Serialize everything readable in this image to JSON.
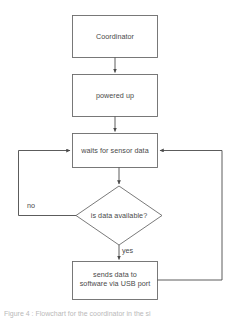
{
  "figure": {
    "type": "flowchart",
    "background_color": "#ffffff",
    "stroke_color": "#595959",
    "text_color": "#4a4a4a",
    "caption": "Figure 4 : Flowchart for the coordinator in the si"
  },
  "nodes": [
    {
      "id": "coordinator",
      "shape": "rectangle",
      "label": "Coordinator",
      "x": 72,
      "y": 15,
      "width": 86,
      "height": 43
    },
    {
      "id": "powered-up",
      "shape": "rectangle",
      "label": "powered up",
      "x": 72,
      "y": 74,
      "width": 86,
      "height": 43
    },
    {
      "id": "waits-for-sensor-data",
      "shape": "rectangle",
      "label": "waits for sensor data",
      "x": 72,
      "y": 133,
      "width": 86,
      "height": 35
    },
    {
      "id": "is-data-available",
      "shape": "diamond",
      "label": "is data available?",
      "x": 76,
      "y": 186,
      "width": 86,
      "height": 59
    },
    {
      "id": "sends-data",
      "shape": "rectangle",
      "label": "sends data to\nsoftware via USB port",
      "x": 72,
      "y": 261,
      "width": 86,
      "height": 39
    }
  ],
  "edges": [
    {
      "id": "coordinator-to-powered-up",
      "from": "coordinator",
      "to": "powered-up",
      "label": ""
    },
    {
      "id": "powered-up-to-waits",
      "from": "powered-up",
      "to": "waits-for-sensor-data",
      "label": ""
    },
    {
      "id": "waits-to-decision",
      "from": "waits-for-sensor-data",
      "to": "is-data-available",
      "label": ""
    },
    {
      "id": "decision-no-loop",
      "from": "is-data-available",
      "to": "waits-for-sensor-data",
      "label": "no"
    },
    {
      "id": "decision-yes-to-sends",
      "from": "is-data-available",
      "to": "sends-data",
      "label": "yes"
    },
    {
      "id": "sends-back-to-waits",
      "from": "sends-data",
      "to": "waits-for-sensor-data",
      "label": ""
    }
  ],
  "labels": {
    "coordinator": "Coordinator",
    "powered_up": "powered up",
    "waits": "waits for sensor data",
    "decision": "is data available?",
    "sends_line1": "sends data to",
    "sends_line2": "software via USB port",
    "sends_full": "sends data to\nsoftware via USB port",
    "no": "no",
    "yes": "yes"
  }
}
